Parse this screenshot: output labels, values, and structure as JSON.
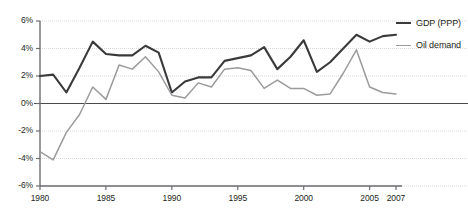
{
  "chart_data": {
    "type": "line",
    "title": "",
    "subtitle": "",
    "xlabel": "",
    "ylabel": "",
    "xlim": [
      1980,
      2007
    ],
    "ylim": [
      -6,
      6
    ],
    "grid": true,
    "grid_axis": "y",
    "legend_position": "right",
    "x": [
      1980,
      1981,
      1982,
      1983,
      1984,
      1985,
      1986,
      1987,
      1988,
      1989,
      1990,
      1991,
      1992,
      1993,
      1994,
      1995,
      1996,
      1997,
      1998,
      1999,
      2000,
      2001,
      2002,
      2003,
      2004,
      2005,
      2006,
      2007
    ],
    "series": [
      {
        "name": "GDP (PPP)",
        "color": "#3a3a3c",
        "values": [
          2.0,
          2.1,
          0.8,
          2.6,
          4.5,
          3.6,
          3.5,
          3.5,
          4.2,
          3.7,
          0.8,
          1.6,
          1.9,
          1.9,
          3.1,
          3.3,
          3.5,
          4.1,
          2.5,
          3.4,
          4.6,
          2.3,
          3.0,
          4.0,
          5.0,
          4.5,
          4.9,
          5.0
        ]
      },
      {
        "name": "Oil demand",
        "color": "#9b9b9e",
        "values": [
          -3.5,
          -4.1,
          -2.1,
          -0.8,
          1.2,
          0.3,
          2.8,
          2.5,
          3.4,
          2.3,
          0.6,
          0.4,
          1.5,
          1.2,
          2.5,
          2.6,
          2.4,
          1.1,
          1.7,
          1.1,
          1.1,
          0.6,
          0.7,
          2.2,
          3.9,
          1.2,
          0.8,
          0.7
        ]
      }
    ],
    "yticks": [
      6,
      4,
      2,
      0,
      -2,
      -4,
      -6
    ],
    "ytick_labels": [
      "6%",
      "4%",
      "2%",
      "0%",
      "-2%",
      "-4%",
      "-6%"
    ],
    "xticks": [
      1980,
      1985,
      1990,
      1995,
      2000,
      2005,
      2007
    ],
    "xtick_labels": [
      "1980",
      "1985",
      "1990",
      "1995",
      "2000",
      "2005",
      "2007"
    ]
  },
  "legend": {
    "items": [
      {
        "label": "GDP (PPP)",
        "series_key": "gdp"
      },
      {
        "label": "Oil demand",
        "series_key": "oil"
      }
    ]
  },
  "colors": {
    "gdp_line": "#3a3a3c",
    "oil_line": "#9b9b9e",
    "axis": "#6d6d70",
    "grid": "#d9d9dc",
    "zero_line": "#4a4a4c",
    "text": "#231f20",
    "background": "#ffffff"
  }
}
